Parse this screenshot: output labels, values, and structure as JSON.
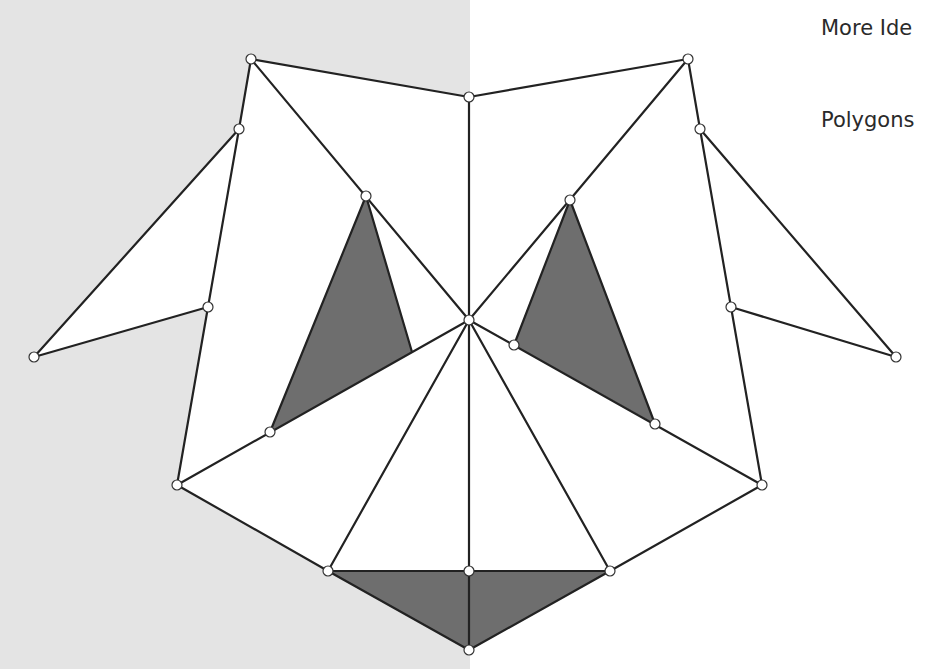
{
  "text": {
    "title": "More Ide",
    "subtitle": "Polygons"
  },
  "colors": {
    "background_left": "#e4e4e4",
    "background_right": "#ffffff",
    "stroke": "#222222",
    "shaded_fill": "#6e6e6e",
    "vertex_fill": "#ffffff"
  },
  "diagram": {
    "vertices": {
      "top_left": [
        251,
        59
      ],
      "top_mid": [
        469,
        97
      ],
      "top_right": [
        688,
        59
      ],
      "left_upper": [
        239,
        129
      ],
      "right_upper": [
        700,
        129
      ],
      "left_wing_inner": [
        208,
        307
      ],
      "right_wing_inner": [
        731,
        307
      ],
      "left_wing_tip": [
        34,
        357
      ],
      "right_wing_tip": [
        896,
        357
      ],
      "left_tri_top": [
        366,
        196
      ],
      "right_tri_top": [
        570,
        200
      ],
      "center": [
        469,
        320
      ],
      "right_tri_left": [
        514,
        345
      ],
      "left_tri_bottom": [
        270,
        432
      ],
      "right_tri_bottom": [
        655,
        424
      ],
      "left_lower": [
        177,
        485
      ],
      "right_lower": [
        762,
        485
      ],
      "bottom_left": [
        328,
        571
      ],
      "bottom_mid": [
        469,
        571
      ],
      "bottom_right": [
        610,
        571
      ],
      "bottom_tip": [
        469,
        650
      ]
    },
    "shaded_polygons": [
      [
        [
          366,
          196
        ],
        [
          412,
          352
        ],
        [
          270,
          432
        ]
      ],
      [
        [
          570,
          200
        ],
        [
          655,
          424
        ],
        [
          514,
          345
        ]
      ],
      [
        [
          328,
          571
        ],
        [
          469,
          571
        ],
        [
          469,
          650
        ]
      ],
      [
        [
          469,
          571
        ],
        [
          610,
          571
        ],
        [
          469,
          650
        ]
      ]
    ],
    "edges": [
      [
        [
          251,
          59
        ],
        [
          469,
          97
        ]
      ],
      [
        [
          469,
          97
        ],
        [
          688,
          59
        ]
      ],
      [
        [
          251,
          59
        ],
        [
          239,
          129
        ]
      ],
      [
        [
          688,
          59
        ],
        [
          700,
          129
        ]
      ],
      [
        [
          239,
          129
        ],
        [
          208,
          307
        ]
      ],
      [
        [
          700,
          129
        ],
        [
          731,
          307
        ]
      ],
      [
        [
          239,
          129
        ],
        [
          34,
          357
        ]
      ],
      [
        [
          34,
          357
        ],
        [
          208,
          307
        ]
      ],
      [
        [
          700,
          129
        ],
        [
          896,
          357
        ]
      ],
      [
        [
          896,
          357
        ],
        [
          731,
          307
        ]
      ],
      [
        [
          208,
          307
        ],
        [
          177,
          485
        ]
      ],
      [
        [
          731,
          307
        ],
        [
          762,
          485
        ]
      ],
      [
        [
          251,
          59
        ],
        [
          469,
          320
        ]
      ],
      [
        [
          688,
          59
        ],
        [
          469,
          320
        ]
      ],
      [
        [
          469,
          97
        ],
        [
          469,
          571
        ]
      ],
      [
        [
          366,
          196
        ],
        [
          412,
          352
        ]
      ],
      [
        [
          366,
          196
        ],
        [
          270,
          432
        ]
      ],
      [
        [
          570,
          200
        ],
        [
          514,
          345
        ]
      ],
      [
        [
          570,
          200
        ],
        [
          655,
          424
        ]
      ],
      [
        [
          469,
          320
        ],
        [
          177,
          485
        ]
      ],
      [
        [
          469,
          320
        ],
        [
          762,
          485
        ]
      ],
      [
        [
          469,
          320
        ],
        [
          328,
          571
        ]
      ],
      [
        [
          469,
          320
        ],
        [
          610,
          571
        ]
      ],
      [
        [
          177,
          485
        ],
        [
          328,
          571
        ]
      ],
      [
        [
          762,
          485
        ],
        [
          610,
          571
        ]
      ],
      [
        [
          328,
          571
        ],
        [
          610,
          571
        ]
      ],
      [
        [
          328,
          571
        ],
        [
          469,
          650
        ]
      ],
      [
        [
          610,
          571
        ],
        [
          469,
          650
        ]
      ],
      [
        [
          469,
          571
        ],
        [
          469,
          650
        ]
      ]
    ]
  }
}
